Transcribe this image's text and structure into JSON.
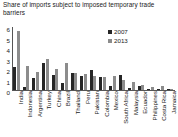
{
  "chart": {
    "title": "Share of imports subject to imposed temporary trade barriers"
  },
  "colors": {
    "series_2007": "#262626",
    "series_2013": "#8c8c8c",
    "axis": "#555555",
    "text": "#1a1a1a",
    "background": "#ffffff"
  },
  "chart_data": {
    "type": "bar",
    "title": "Share of imports subject to imposed temporary trade barriers",
    "xlabel": "",
    "ylabel": "",
    "ylim": [
      0,
      6
    ],
    "ytick_labels": [
      "6",
      "5",
      "4",
      "3",
      "2",
      "1",
      "0"
    ],
    "yticks": [
      6,
      5,
      4,
      3,
      2,
      1,
      0
    ],
    "grid": false,
    "legend_position": "top-right",
    "categories": [
      "India",
      "Indonesia",
      "Argentina",
      "Turkey",
      "China",
      "Brazil",
      "Thailand",
      "Peru",
      "Pakistan",
      "Colombia",
      "Mexico",
      "South Africa",
      "Malaysia",
      "Ecuador",
      "Philippines",
      "Costa Rica",
      "Jamaica"
    ],
    "series": [
      {
        "name": "2007",
        "color": "#262626",
        "values": [
          2.2,
          0.3,
          1.1,
          2.6,
          1.4,
          0.7,
          1.6,
          1.3,
          1.9,
          1.2,
          0.4,
          1.4,
          0.15,
          0.4,
          0.1,
          0.1,
          0.05
        ]
      },
      {
        "name": "2013",
        "color": "#8c8c8c",
        "values": [
          5.6,
          2.3,
          1.7,
          3.0,
          2.0,
          2.6,
          1.6,
          1.5,
          1.3,
          1.2,
          1.3,
          1.0,
          0.8,
          0.5,
          0.25,
          0.35,
          0.1
        ]
      }
    ]
  },
  "legend": {
    "entries": [
      {
        "label": "2007",
        "color": "#262626"
      },
      {
        "label": "2013",
        "color": "#8c8c8c"
      }
    ]
  }
}
